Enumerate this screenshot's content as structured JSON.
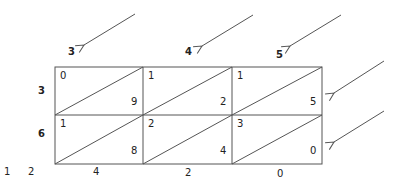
{
  "diagram": {
    "type": "lattice-multiplication",
    "multiplicand_digits": [
      "3",
      "4",
      "5"
    ],
    "multiplier_digits": [
      "3",
      "6"
    ],
    "cells": [
      [
        {
          "tens": "0",
          "ones": "9"
        },
        {
          "tens": "1",
          "ones": "2"
        },
        {
          "tens": "1",
          "ones": "5"
        }
      ],
      [
        {
          "tens": "1",
          "ones": "8"
        },
        {
          "tens": "2",
          "ones": "4"
        },
        {
          "tens": "3",
          "ones": "0"
        }
      ]
    ],
    "result_left": [
      "1",
      "2"
    ],
    "result_bottom": [
      "4",
      "2",
      "0"
    ],
    "stroke_color": "#555555"
  }
}
